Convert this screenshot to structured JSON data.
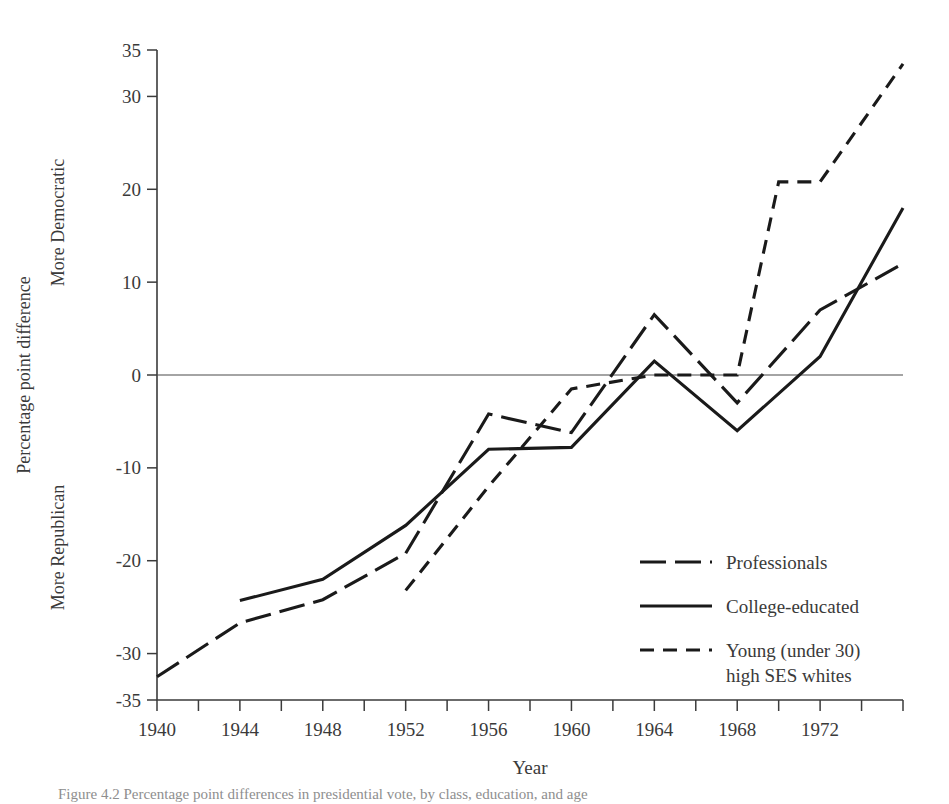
{
  "figure": {
    "caption": "Figure 4.2  Percentage point differences in presidential vote, by class, education, and age"
  },
  "chart_data": {
    "type": "line",
    "title": "",
    "xlabel": "Year",
    "ylabel": "Percentage point difference",
    "ylabel_upper": "More Democratic",
    "ylabel_lower": "More Republican",
    "xlim": [
      1940,
      1976
    ],
    "ylim": [
      -35,
      35
    ],
    "grid": false,
    "legend_position": "inside-lower-right",
    "x_tick_labels": [
      "1940",
      "1944",
      "1948",
      "1952",
      "1956",
      "1960",
      "1964",
      "1968",
      "1972"
    ],
    "x_tick_values": [
      1940,
      1944,
      1948,
      1952,
      1956,
      1960,
      1964,
      1968,
      1972
    ],
    "x_minor_ticks": [
      1942,
      1946,
      1950,
      1954,
      1958,
      1962,
      1966,
      1970,
      1974,
      1976
    ],
    "y_tick_labels": [
      "35",
      "30",
      "20",
      "10",
      "0",
      "-10",
      "-20",
      "-30",
      "-35"
    ],
    "y_tick_values": [
      35,
      30,
      20,
      10,
      0,
      -10,
      -20,
      -30,
      -35
    ],
    "series": [
      {
        "name": "Professionals",
        "style": "long-dash",
        "x": [
          1940,
          1944,
          1948,
          1952,
          1956,
          1960,
          1964,
          1968,
          1972,
          1976
        ],
        "values": [
          -32.5,
          -26.7,
          -24.2,
          -19.2,
          -4.2,
          -6.2,
          6.5,
          -3.0,
          7.0,
          12.0
        ]
      },
      {
        "name": "College-educated",
        "style": "solid",
        "x": [
          1944,
          1948,
          1952,
          1956,
          1960,
          1964,
          1968,
          1972,
          1976
        ],
        "values": [
          -24.3,
          -22.0,
          -16.2,
          -8.0,
          -7.8,
          1.5,
          -6.0,
          2.0,
          18.0
        ]
      },
      {
        "name": "Young (under 30) high SES whites",
        "style": "dash",
        "x": [
          1952,
          1956,
          1960,
          1964,
          1968,
          1970,
          1972,
          1976
        ],
        "values": [
          -23.2,
          -12.0,
          -1.5,
          0.0,
          0.0,
          20.8,
          20.8,
          33.5
        ]
      }
    ],
    "legend": [
      {
        "label": "Professionals",
        "style": "long-dash"
      },
      {
        "label": "College-educated",
        "style": "solid"
      },
      {
        "label": "Young (under 30)",
        "label2": "high SES whites",
        "style": "dash"
      }
    ]
  }
}
